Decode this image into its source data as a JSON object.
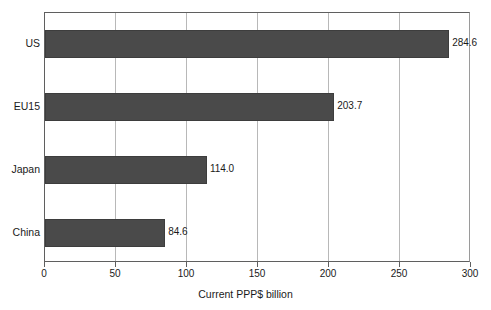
{
  "chart_data": {
    "type": "bar",
    "orientation": "horizontal",
    "title": "",
    "xlabel": "Current PPP$ billion",
    "ylabel": "",
    "categories": [
      "US",
      "EU15",
      "Japan",
      "China"
    ],
    "values": [
      284.6,
      203.7,
      114.0,
      84.6
    ],
    "value_labels": [
      "284.6",
      "203.7",
      "114.0",
      "84.6"
    ],
    "xlim": [
      0,
      300
    ],
    "xticks": [
      0,
      50,
      100,
      150,
      200,
      250,
      300
    ],
    "xtick_labels": [
      "0",
      "50",
      "100",
      "150",
      "200",
      "250",
      "300"
    ],
    "grid": "vertical",
    "legend": "none",
    "series": [
      {
        "name": "Current PPP$ billion",
        "values": [
          284.6,
          203.7,
          114.0,
          84.6
        ]
      }
    ],
    "colors": {
      "bar_fill": "#4a4a4a",
      "bar_edge": "#3d3d3d",
      "gridline": "#b8b8b8",
      "axis": "#5f5f5f",
      "background": "#ffffff",
      "text": "#1a1a1a"
    }
  }
}
